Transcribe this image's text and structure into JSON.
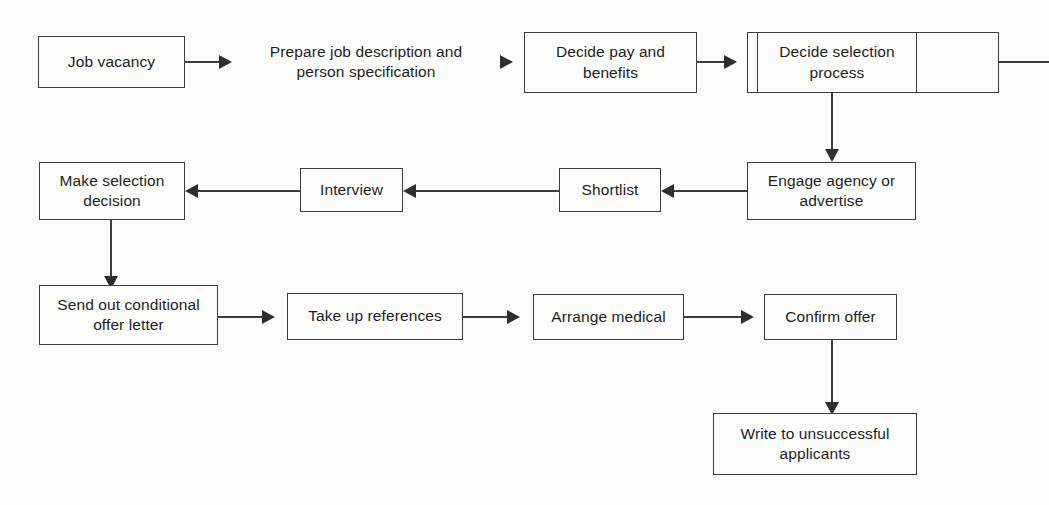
{
  "diagram": {
    "background_color": "#fdfdfb",
    "stroke_color": "#3c3c3c",
    "text_color": "#1d1d1d"
  },
  "nodes": {
    "job_vacancy": "Job vacancy",
    "prepare_job_description": "Prepare job description and person specification",
    "decide_pay": "Decide pay and benefits",
    "decide_selection_process": "Decide selection process",
    "blank_cell": "",
    "sliver_cell": "",
    "engage_agency": "Engage agency or advertise",
    "shortlist": "Shortlist",
    "interview": "Interview",
    "make_selection_decision": "Make selection decision",
    "send_offer_letter": "Send out conditional offer letter",
    "take_up_references": "Take up references",
    "arrange_medical": "Arrange medical",
    "confirm_offer": "Confirm offer",
    "write_unsuccessful": "Write to unsuccessful applicants"
  },
  "edges": [
    {
      "name": "job-vacancy-to-prepare",
      "direction": "right"
    },
    {
      "name": "prepare-to-decide-pay",
      "direction": "right"
    },
    {
      "name": "decide-pay-to-decide-selection",
      "direction": "right"
    },
    {
      "name": "decide-selection-to-engage-agency",
      "direction": "down"
    },
    {
      "name": "engage-agency-to-shortlist",
      "direction": "left"
    },
    {
      "name": "shortlist-to-interview",
      "direction": "left"
    },
    {
      "name": "interview-to-make-selection",
      "direction": "left"
    },
    {
      "name": "make-selection-to-send-offer",
      "direction": "down"
    },
    {
      "name": "send-offer-to-references",
      "direction": "right"
    },
    {
      "name": "references-to-arrange-medical",
      "direction": "right"
    },
    {
      "name": "arrange-medical-to-confirm-offer",
      "direction": "right"
    },
    {
      "name": "confirm-offer-to-write-unsuccessful",
      "direction": "down"
    },
    {
      "name": "trailing-edge-line",
      "direction": "right"
    }
  ]
}
